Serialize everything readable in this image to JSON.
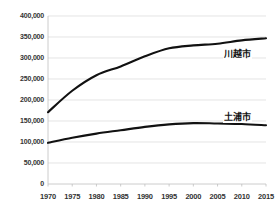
{
  "chart_data": {
    "type": "line",
    "title": "",
    "xlabel": "",
    "ylabel": "",
    "x": [
      1970,
      1975,
      1980,
      1985,
      1990,
      1995,
      2000,
      2005,
      2010,
      2015
    ],
    "xlim": [
      1970,
      2015
    ],
    "ylim": [
      0,
      400000
    ],
    "grid": true,
    "legend_position": "inline-right",
    "yticks": [
      0,
      50000,
      100000,
      150000,
      200000,
      250000,
      300000,
      350000,
      400000
    ],
    "ytick_labels": [
      "0",
      "50,000",
      "100,000",
      "150,000",
      "200,000",
      "250,000",
      "300,000",
      "350,000",
      "400,000"
    ],
    "xtick_labels": [
      "1970",
      "1975",
      "1980",
      "1985",
      "1990",
      "1995",
      "2000",
      "2005",
      "2010",
      "2015"
    ],
    "series": [
      {
        "name": "川越市",
        "color": "#111111",
        "values": [
          171000,
          222000,
          259000,
          280000,
          304000,
          323000,
          330000,
          334000,
          342000,
          347000
        ]
      },
      {
        "name": "土浦市",
        "color": "#111111",
        "values": [
          98000,
          110000,
          120000,
          128000,
          136000,
          142000,
          145000,
          144000,
          143000,
          140000
        ]
      }
    ],
    "annotations": [
      {
        "name": "川越市",
        "x": 2009,
        "y": 312000
      },
      {
        "name": "土浦市",
        "x": 2009,
        "y": 163000
      }
    ]
  },
  "colors": {
    "line": "#111111",
    "grid": "#d9d9d9",
    "axis": "#bfbfbf",
    "text": "#333333",
    "background": "#ffffff"
  }
}
